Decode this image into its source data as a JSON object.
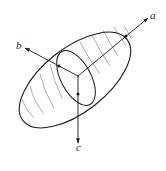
{
  "diagram": {
    "type": "ellipsoid-with-principal-axes",
    "axes": [
      {
        "id": "a",
        "label": "a"
      },
      {
        "id": "b",
        "label": "b"
      },
      {
        "id": "c",
        "label": "c"
      }
    ],
    "colors": {
      "outline": "#1a1a1a",
      "latitude_lines": "#8a8a8a",
      "background": "#ffffff"
    }
  }
}
